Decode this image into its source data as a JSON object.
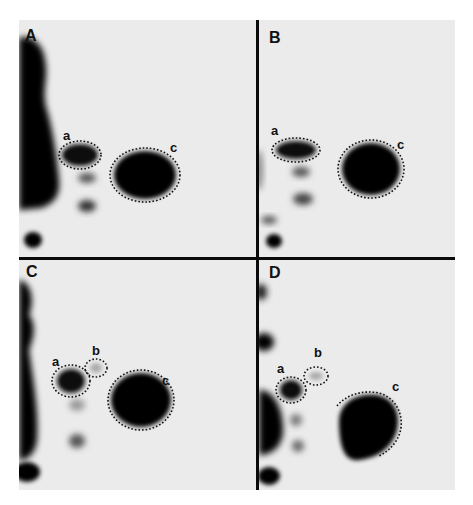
{
  "figure": {
    "panels": [
      {
        "id": "A",
        "label": "A",
        "spots": [
          {
            "label": "a"
          },
          {
            "label": "c"
          }
        ]
      },
      {
        "id": "B",
        "label": "B",
        "spots": [
          {
            "label": "a"
          },
          {
            "label": "c"
          }
        ]
      },
      {
        "id": "C",
        "label": "C",
        "spots": [
          {
            "label": "a"
          },
          {
            "label": "b"
          },
          {
            "label": "c"
          }
        ]
      },
      {
        "id": "D",
        "label": "D",
        "spots": [
          {
            "label": "a"
          },
          {
            "label": "b"
          },
          {
            "label": "c"
          }
        ]
      }
    ],
    "colors": {
      "background": "#ebebeb",
      "spot": "#050505",
      "divider": "#0a0a0a",
      "outline": "#111111"
    }
  }
}
